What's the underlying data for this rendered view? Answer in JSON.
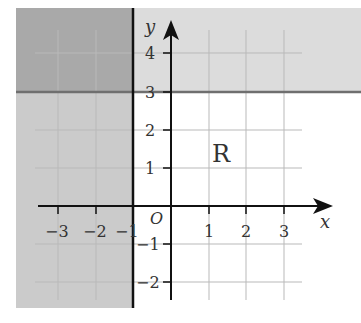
{
  "diagram": {
    "type": "coordinate-plane-region",
    "axes": {
      "x_label": "x",
      "y_label": "y",
      "origin_label": "O",
      "x_ticks": [
        "−3",
        "−2",
        "−1",
        "1",
        "2",
        "3"
      ],
      "y_ticks": [
        "4",
        "3",
        "2",
        "1",
        "−1",
        "−2"
      ]
    },
    "region_label": "R",
    "boundaries": [
      {
        "name": "horizontal-line",
        "equation": "y = 3"
      },
      {
        "name": "vertical-line",
        "equation": "x = -1"
      }
    ],
    "shaded": {
      "band_above_y3": "y ≥ 3",
      "band_left_of_x_neg1": "x ≤ -1"
    },
    "colors": {
      "light_shade": "#dcdcdc",
      "left_shade": "#cbcbcb",
      "overlap_shade": "#a9a9a9",
      "boundary_line": "#6f6f6f",
      "axis": "#111111",
      "grid": "#b9b9b9"
    }
  }
}
